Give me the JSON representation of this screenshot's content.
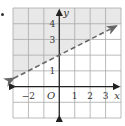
{
  "problem_marker": "•",
  "chart_data": {
    "type": "line",
    "title": "",
    "inequality": "y > (1/2)x + 2",
    "xlabel": "x",
    "ylabel": "y",
    "origin_label": "O",
    "xlim": [
      -3,
      4
    ],
    "ylim": [
      -2,
      5
    ],
    "x_ticks": [
      {
        "value": -2,
        "label": "−2"
      },
      {
        "value": 1,
        "label": "1"
      },
      {
        "value": 2,
        "label": "2"
      },
      {
        "value": 3,
        "label": "3"
      }
    ],
    "y_ticks": [
      {
        "value": 1,
        "label": "1"
      },
      {
        "value": 3,
        "label": "3"
      },
      {
        "value": 4,
        "label": "4"
      }
    ],
    "grid": true,
    "series": [
      {
        "name": "boundary",
        "style": "dashed",
        "arrows": "both",
        "slope": 0.5,
        "intercept": 2,
        "points": [
          [
            -3,
            0.5
          ],
          [
            0,
            2
          ],
          [
            2,
            3
          ],
          [
            3.5,
            3.75
          ]
        ]
      }
    ],
    "shaded_region": "above boundary",
    "colors": {
      "shade": "#e8e8e8",
      "grid": "#a9a9a9",
      "axis": "#222222",
      "boundary": "#666666"
    }
  }
}
